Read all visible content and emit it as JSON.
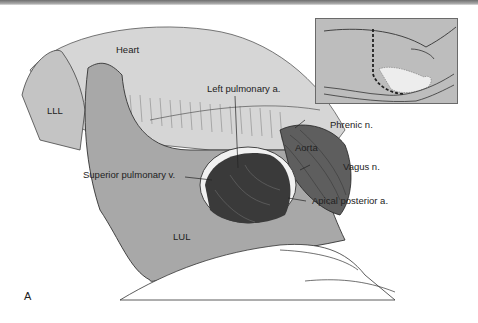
{
  "figure": {
    "panel_letter": "A",
    "labels": {
      "heart": "Heart",
      "lll": "LLL",
      "left_pulmonary_artery": "Left pulmonary a.",
      "phrenic_nerve": "Phrenic n.",
      "aorta": "Aorta",
      "vagus_nerve": "Vagus n.",
      "superior_pulmonary_vein": "Superior pulmonary v.",
      "apical_posterior_artery": "Apical posterior a.",
      "lul": "LUL"
    },
    "colors": {
      "background": "#ffffff",
      "heart_fill": "#d4d4d4",
      "lung_fill": "#a8a8a8",
      "aorta_fill": "#5a5a5a",
      "window_fill": "#3a3a3a",
      "inset_fill": "#bdbdbd",
      "label_text": "#222222"
    }
  }
}
